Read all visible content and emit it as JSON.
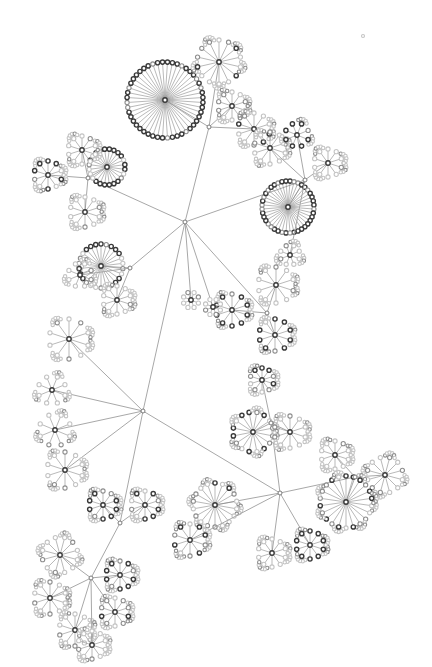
{
  "colors": {
    "background": "#ffffff",
    "edge": "#a8a8a8",
    "spoke": "#8a8a8a",
    "node_light": "#c4c4c4",
    "node_mid": "#8e8e8e",
    "node_dark": "#3a3a3a"
  },
  "hubs": [
    {
      "id": "root",
      "x": 185,
      "y": 222
    },
    {
      "id": "hub-lower",
      "x": 143,
      "y": 411
    },
    {
      "id": "hub-right-lower",
      "x": 280,
      "y": 493
    },
    {
      "id": "hub-upper-mid",
      "x": 209,
      "y": 127
    },
    {
      "id": "hub-left-upper",
      "x": 88,
      "y": 178
    },
    {
      "id": "hub-left-mid",
      "x": 130,
      "y": 268
    },
    {
      "id": "hub-right-mid",
      "x": 267,
      "y": 313
    },
    {
      "id": "hub-right-upper",
      "x": 305,
      "y": 180
    },
    {
      "id": "hub-mid-lower",
      "x": 271,
      "y": 423
    },
    {
      "id": "hub-bottom-left",
      "x": 91,
      "y": 578
    },
    {
      "id": "hub-bottom-left-2",
      "x": 120,
      "y": 523
    },
    {
      "id": "hub-right-far",
      "x": 355,
      "y": 477
    }
  ],
  "edges": [
    [
      "root",
      "hub-upper-mid"
    ],
    [
      "root",
      "hub-left-upper"
    ],
    [
      "root",
      "hub-left-mid"
    ],
    [
      "root",
      "hub-right-mid"
    ],
    [
      "root",
      "hub-right-upper"
    ],
    [
      "root",
      "hub-lower"
    ],
    [
      "hub-lower",
      "hub-right-lower"
    ],
    [
      "hub-lower",
      "hub-bottom-left-2"
    ],
    [
      "hub-bottom-left-2",
      "hub-bottom-left"
    ],
    [
      "hub-right-lower",
      "hub-mid-lower"
    ],
    [
      "hub-right-lower",
      "hub-right-far"
    ]
  ],
  "clusters": [
    {
      "parent": "hub-upper-mid",
      "x": 165,
      "y": 100,
      "r": 38,
      "n": 48,
      "sub": 0,
      "tone": "dark",
      "fan": [
        0,
        360
      ]
    },
    {
      "parent": "hub-upper-mid",
      "x": 219,
      "y": 62,
      "r": 22,
      "n": 14,
      "sub": 4,
      "tone": "mid",
      "fan": [
        0,
        360
      ]
    },
    {
      "parent": "hub-upper-mid",
      "x": 232,
      "y": 106,
      "r": 14,
      "n": 10,
      "sub": 3,
      "tone": "light",
      "fan": [
        0,
        360
      ]
    },
    {
      "parent": "hub-upper-mid",
      "x": 254,
      "y": 129,
      "r": 16,
      "n": 10,
      "sub": 3,
      "tone": "mid",
      "fan": [
        0,
        360
      ]
    },
    {
      "parent": "hub-right-upper",
      "x": 288,
      "y": 207,
      "r": 26,
      "n": 40,
      "sub": 0,
      "tone": "dark",
      "fan": [
        90,
        450
      ]
    },
    {
      "parent": "hub-right-upper",
      "x": 270,
      "y": 148,
      "r": 16,
      "n": 10,
      "sub": 3,
      "tone": "light",
      "fan": [
        0,
        360
      ]
    },
    {
      "parent": "hub-right-upper",
      "x": 328,
      "y": 163,
      "r": 14,
      "n": 10,
      "sub": 3,
      "tone": "light",
      "fan": [
        0,
        360
      ]
    },
    {
      "parent": "hub-right-upper",
      "x": 297,
      "y": 135,
      "r": 12,
      "n": 8,
      "sub": 2,
      "tone": "dark",
      "fan": [
        0,
        360
      ]
    },
    {
      "parent": "hub-right-upper",
      "x": 290,
      "y": 255,
      "r": 10,
      "n": 8,
      "sub": 2,
      "tone": "light",
      "fan": [
        0,
        360
      ]
    },
    {
      "parent": "hub-left-upper",
      "x": 48,
      "y": 175,
      "r": 14,
      "n": 10,
      "sub": 3,
      "tone": "mid",
      "fan": [
        0,
        360
      ]
    },
    {
      "parent": "hub-left-upper",
      "x": 107,
      "y": 167,
      "r": 18,
      "n": 24,
      "sub": 0,
      "tone": "mid",
      "fan": [
        0,
        360
      ]
    },
    {
      "parent": "hub-left-upper",
      "x": 82,
      "y": 150,
      "r": 14,
      "n": 10,
      "sub": 3,
      "tone": "light",
      "fan": [
        0,
        360
      ]
    },
    {
      "parent": "hub-left-upper",
      "x": 85,
      "y": 212,
      "r": 15,
      "n": 10,
      "sub": 3,
      "tone": "light",
      "fan": [
        0,
        360
      ]
    },
    {
      "parent": "hub-left-mid",
      "x": 101,
      "y": 266,
      "r": 22,
      "n": 26,
      "sub": 0,
      "tone": "mid",
      "fan": [
        0,
        360
      ]
    },
    {
      "parent": "hub-left-mid",
      "x": 117,
      "y": 300,
      "r": 14,
      "n": 10,
      "sub": 3,
      "tone": "light",
      "fan": [
        0,
        360
      ]
    },
    {
      "parent": "hub-left-mid",
      "x": 80,
      "y": 275,
      "r": 12,
      "n": 8,
      "sub": 2,
      "tone": "light",
      "fan": [
        0,
        360
      ]
    },
    {
      "parent": "hub-right-mid",
      "x": 232,
      "y": 310,
      "r": 16,
      "n": 10,
      "sub": 3,
      "tone": "dark",
      "fan": [
        0,
        360
      ]
    },
    {
      "parent": "hub-right-mid",
      "x": 276,
      "y": 285,
      "r": 18,
      "n": 10,
      "sub": 3,
      "tone": "light",
      "fan": [
        0,
        360
      ]
    },
    {
      "parent": "hub-right-mid",
      "x": 275,
      "y": 335,
      "r": 16,
      "n": 10,
      "sub": 3,
      "tone": "mid",
      "fan": [
        0,
        360
      ]
    },
    {
      "parent": "root",
      "x": 191,
      "y": 300,
      "r": 8,
      "n": 8,
      "sub": 0,
      "tone": "light",
      "fan": [
        0,
        360
      ]
    },
    {
      "parent": "root",
      "x": 213,
      "y": 307,
      "r": 8,
      "n": 8,
      "sub": 0,
      "tone": "light",
      "fan": [
        0,
        360
      ]
    },
    {
      "parent": "hub-lower",
      "x": 69,
      "y": 339,
      "r": 20,
      "n": 10,
      "sub": 3,
      "tone": "light",
      "fan": [
        0,
        360
      ]
    },
    {
      "parent": "hub-lower",
      "x": 52,
      "y": 390,
      "r": 14,
      "n": 8,
      "sub": 2,
      "tone": "light",
      "fan": [
        0,
        360
      ]
    },
    {
      "parent": "hub-lower",
      "x": 55,
      "y": 430,
      "r": 16,
      "n": 8,
      "sub": 3,
      "tone": "light",
      "fan": [
        0,
        360
      ]
    },
    {
      "parent": "hub-lower",
      "x": 65,
      "y": 470,
      "r": 18,
      "n": 10,
      "sub": 3,
      "tone": "light",
      "fan": [
        0,
        360
      ]
    },
    {
      "parent": "hub-mid-lower",
      "x": 253,
      "y": 432,
      "r": 20,
      "n": 16,
      "sub": 3,
      "tone": "mid",
      "fan": [
        0,
        360
      ]
    },
    {
      "parent": "hub-mid-lower",
      "x": 290,
      "y": 432,
      "r": 16,
      "n": 10,
      "sub": 3,
      "tone": "light",
      "fan": [
        0,
        360
      ]
    },
    {
      "parent": "hub-mid-lower",
      "x": 262,
      "y": 380,
      "r": 12,
      "n": 10,
      "sub": 2,
      "tone": "mid",
      "fan": [
        0,
        360
      ]
    },
    {
      "parent": "hub-right-far",
      "x": 385,
      "y": 475,
      "r": 18,
      "n": 12,
      "sub": 3,
      "tone": "light",
      "fan": [
        0,
        360
      ]
    },
    {
      "parent": "hub-right-far",
      "x": 346,
      "y": 502,
      "r": 26,
      "n": 22,
      "sub": 3,
      "tone": "mid",
      "fan": [
        0,
        360
      ]
    },
    {
      "parent": "hub-right-far",
      "x": 335,
      "y": 455,
      "r": 14,
      "n": 10,
      "sub": 3,
      "tone": "light",
      "fan": [
        0,
        360
      ]
    },
    {
      "parent": "hub-right-lower",
      "x": 215,
      "y": 505,
      "r": 22,
      "n": 18,
      "sub": 3,
      "tone": "mid",
      "fan": [
        0,
        360
      ]
    },
    {
      "parent": "hub-right-lower",
      "x": 272,
      "y": 553,
      "r": 14,
      "n": 10,
      "sub": 3,
      "tone": "light",
      "fan": [
        0,
        360
      ]
    },
    {
      "parent": "hub-right-lower",
      "x": 310,
      "y": 545,
      "r": 14,
      "n": 10,
      "sub": 3,
      "tone": "dark",
      "fan": [
        0,
        360
      ]
    },
    {
      "parent": "hub-right-lower",
      "x": 190,
      "y": 540,
      "r": 16,
      "n": 10,
      "sub": 3,
      "tone": "mid",
      "fan": [
        0,
        360
      ]
    },
    {
      "parent": "hub-bottom-left-2",
      "x": 103,
      "y": 505,
      "r": 14,
      "n": 10,
      "sub": 3,
      "tone": "dark",
      "fan": [
        0,
        360
      ]
    },
    {
      "parent": "hub-bottom-left-2",
      "x": 145,
      "y": 505,
      "r": 14,
      "n": 10,
      "sub": 3,
      "tone": "mid",
      "fan": [
        0,
        360
      ]
    },
    {
      "parent": "hub-bottom-left",
      "x": 60,
      "y": 555,
      "r": 18,
      "n": 12,
      "sub": 3,
      "tone": "light",
      "fan": [
        0,
        360
      ]
    },
    {
      "parent": "hub-bottom-left",
      "x": 120,
      "y": 575,
      "r": 14,
      "n": 10,
      "sub": 3,
      "tone": "dark",
      "fan": [
        0,
        360
      ]
    },
    {
      "parent": "hub-bottom-left",
      "x": 50,
      "y": 598,
      "r": 16,
      "n": 10,
      "sub": 3,
      "tone": "light",
      "fan": [
        0,
        360
      ]
    },
    {
      "parent": "hub-bottom-left",
      "x": 75,
      "y": 630,
      "r": 16,
      "n": 10,
      "sub": 3,
      "tone": "light",
      "fan": [
        0,
        360
      ]
    },
    {
      "parent": "hub-bottom-left",
      "x": 115,
      "y": 612,
      "r": 14,
      "n": 10,
      "sub": 3,
      "tone": "mid",
      "fan": [
        0,
        360
      ]
    },
    {
      "parent": "hub-bottom-left",
      "x": 92,
      "y": 645,
      "r": 14,
      "n": 10,
      "sub": 3,
      "tone": "light",
      "fan": [
        0,
        360
      ]
    }
  ],
  "stray_nodes": [
    {
      "x": 363,
      "y": 36,
      "tone": "light"
    }
  ]
}
